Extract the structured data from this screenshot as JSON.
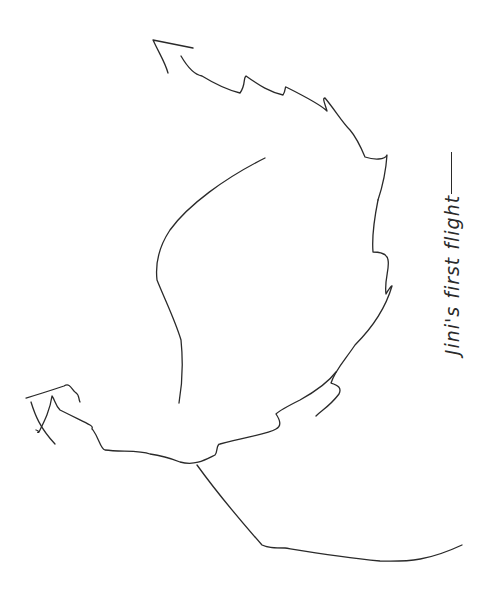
{
  "drawing": {
    "caption": "Jini's first flight",
    "stroke_color": "#2a2a2a",
    "background": "#ffffff",
    "orientation": "rotated 90° counter-clockwise"
  }
}
